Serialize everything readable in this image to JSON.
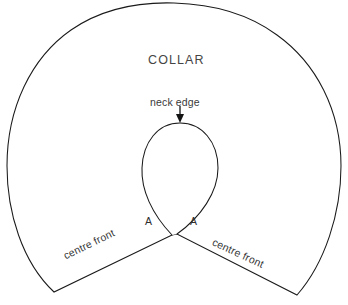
{
  "figure": {
    "kind": "sewing-pattern-diagram",
    "subject": "COLLAR",
    "background_color": "#ffffff",
    "line_color": "#1a1a1a",
    "text_color": "#3a3a3a"
  },
  "labels": {
    "collar": "COLLAR",
    "neck_edge": "neck edge",
    "notch_left": "A",
    "notch_right": "A",
    "centre_front_left": "centre front",
    "centre_front_right": "centre front"
  },
  "annotations": {
    "neck_edge_arrow": {
      "icon": "arrow-down-icon",
      "direction": "down",
      "points_to": "neck edge"
    }
  },
  "geometry": {
    "canvas": {
      "width": 348,
      "height": 305
    },
    "outer_edge": {
      "description": "large open arc forming the outer collar edge",
      "apex": [
        174,
        3
      ],
      "left_extreme": [
        7,
        162
      ],
      "right_extreme": [
        341,
        162
      ],
      "left_end": [
        54,
        292
      ],
      "right_end": [
        297,
        295
      ]
    },
    "neck_edge": {
      "description": "inner teardrop neck opening",
      "apex": [
        180,
        123
      ],
      "left_tip": [
        172,
        235
      ],
      "right_tip": [
        177,
        234
      ],
      "widest_left": [
        142,
        165
      ],
      "widest_right": [
        218,
        165
      ]
    },
    "centre_front_left_line": {
      "from": [
        54,
        292
      ],
      "to": [
        172,
        235
      ]
    },
    "centre_front_right_line": {
      "from": [
        177,
        234
      ],
      "to": [
        297,
        295
      ]
    }
  }
}
